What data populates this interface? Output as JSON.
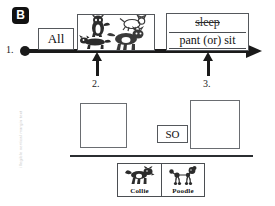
{
  "page": {
    "section_badge": "B",
    "watermark": "illegible vertical margin text"
  },
  "timeline": {
    "step_1_label": "1.",
    "step_2_label": "2.",
    "step_3_label": "3.",
    "subject_box": "All",
    "subject_picture": "four-dogs-illustration",
    "predicate": {
      "crossed_out_word": "sleep",
      "replacement_text": "pant (or) sit"
    },
    "arrow_right_icon": "arrow-right-icon",
    "arrow_up_2_icon": "arrow-up-icon",
    "arrow_up_3_icon": "arrow-up-icon",
    "start_dot_icon": "filled-dot-icon"
  },
  "workspace": {
    "answer_box_2": "",
    "answer_box_3": "",
    "connector_label": "SO"
  },
  "card_tray": {
    "cards": [
      {
        "label": "Collie",
        "art": "collie-dog-icon"
      },
      {
        "label": "Poodle",
        "art": "poodle-dog-icon"
      }
    ]
  }
}
